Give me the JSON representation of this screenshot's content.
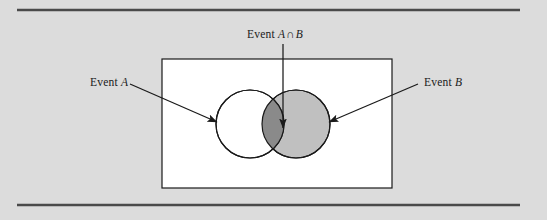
{
  "figure": {
    "kind": "venn-diagram",
    "background_color": "#dcdcdc",
    "rule_color": "#4a4a4a",
    "panel_fill": "#ffffff",
    "panel_stroke": "#1a1a1a",
    "stroke_color": "#1a1a1a"
  },
  "labels": {
    "event_a": {
      "prefix": "Event",
      "symbol": "A"
    },
    "event_b": {
      "prefix": "Event",
      "symbol": "B"
    },
    "intersection": {
      "prefix": "Event",
      "left": "A",
      "operator": "∩",
      "right": "B"
    }
  },
  "sets": {
    "a": {
      "name": "Event A",
      "fill_color": "#ffffff",
      "cx": 250,
      "cy": 124,
      "r": 34
    },
    "b": {
      "name": "Event B",
      "fill_color": "#c0c0c0",
      "cx": 296,
      "cy": 124,
      "r": 34
    },
    "intersection": {
      "name": "Event A ∩ B",
      "fill_color": "#8a8a8a"
    }
  },
  "panel": {
    "x": 162,
    "y": 59,
    "width": 230,
    "height": 129
  },
  "rules": {
    "top_y": 10,
    "bottom_y": 205,
    "x_start": 17,
    "x_end": 520
  },
  "annotations": [
    {
      "name": "pointer-event-a",
      "from_x": 130,
      "from_y": 84,
      "to_x": 217,
      "to_y": 122
    },
    {
      "name": "pointer-event-b",
      "from_x": 418,
      "from_y": 84,
      "to_x": 329,
      "to_y": 122
    },
    {
      "name": "pointer-intersection",
      "from_x": 283,
      "from_y": 44,
      "to_x": 283,
      "to_y": 128
    }
  ]
}
